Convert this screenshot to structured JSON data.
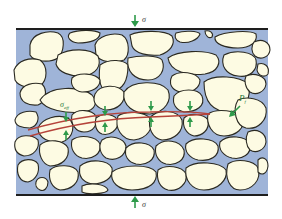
{
  "diagram": {
    "labels": {
      "sigma_top": "σ",
      "sigma_bottom": "σ",
      "sigma_eff": "σ",
      "sigma_eff_sub": "eff",
      "pore_pressure": "P",
      "pore_pressure_sub": "f"
    },
    "colors": {
      "background": "#ffffff",
      "pore_fluid": "#9fb4d8",
      "grain_fill": "#fdfbe3",
      "grain_outline": "#2b2a22",
      "boundary": "#1e1e1e",
      "stress_arrow": "#2e9a4a",
      "fracture": "#b5433a"
    },
    "stress_arrow_pairs": 4,
    "fracture_count": 1
  }
}
